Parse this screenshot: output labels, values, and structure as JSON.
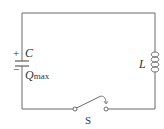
{
  "diagram": {
    "capacitor": {
      "symbol": "C",
      "plus": "+",
      "minus": "−",
      "charge_symbol": "Q",
      "charge_sub": "max"
    },
    "inductor": {
      "symbol": "L"
    },
    "switch": {
      "symbol": "S"
    },
    "colors": {
      "wire": "#6a6a6a",
      "text": "#333333"
    }
  }
}
